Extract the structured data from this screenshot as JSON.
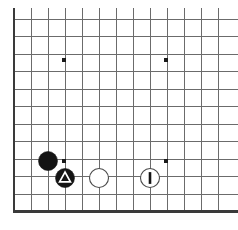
{
  "figure": {
    "kind": "go-board-diagram",
    "background_color": "#ffffff"
  },
  "board": {
    "line_color": "#6b6b6b",
    "edge_color": "#3a3a3a",
    "line_width": 1,
    "edge_width": 2.4,
    "origin_x": 14,
    "origin_y": 19,
    "spacing_x": 17,
    "spacing_y": 17.5,
    "columns": 13,
    "rows": 12,
    "cropped_edges": [
      "top",
      "right"
    ],
    "solid_edges": [
      "left",
      "bottom"
    ]
  },
  "star_points": {
    "color": "#1a1a1a",
    "radius": 2.4,
    "points": [
      {
        "name": "star-point-upper-left",
        "x": 64,
        "y": 60
      },
      {
        "name": "star-point-upper-right",
        "x": 166,
        "y": 60
      },
      {
        "name": "star-point-lower-left",
        "x": 64,
        "y": 161
      },
      {
        "name": "star-point-lower-right",
        "x": 166,
        "y": 161
      }
    ]
  },
  "stones": {
    "black_color": "#141414",
    "white_color": "#ffffff",
    "white_outline_color": "#4a4a4a",
    "radius": 9.5,
    "items": [
      {
        "name": "black-stone-plain",
        "color": "black",
        "x": 48,
        "y": 161,
        "mark": "none",
        "mark_label": ""
      },
      {
        "name": "black-stone-triangle",
        "color": "black",
        "x": 65,
        "y": 178,
        "mark": "triangle",
        "mark_label": "triangle"
      },
      {
        "name": "white-stone-plain",
        "color": "white",
        "x": 99,
        "y": 178,
        "mark": "none",
        "mark_label": ""
      },
      {
        "name": "white-stone-bar",
        "color": "white",
        "x": 150,
        "y": 178,
        "mark": "bar",
        "mark_label": "1"
      }
    ]
  }
}
